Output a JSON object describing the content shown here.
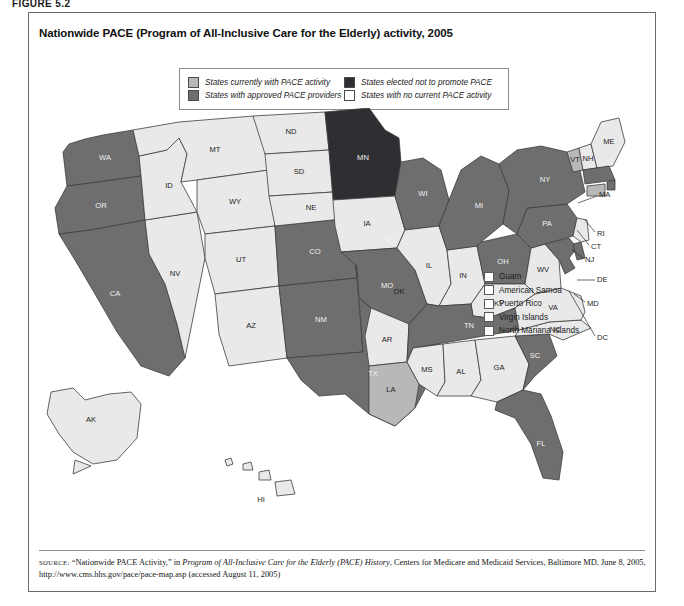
{
  "figure": {
    "label": "FIGURE 5.2"
  },
  "title": "Nationwide PACE (Program of All-Inclusive Care for the Elderly) activity, 2005",
  "legend": {
    "items": [
      {
        "label": "States currently with PACE activity",
        "color": "#b8b8b8"
      },
      {
        "label": "States elected not to promote PACE",
        "color": "#2f2f33"
      },
      {
        "label": "States with approved PACE providers",
        "color": "#6e6e6e"
      },
      {
        "label": "States with no current PACE activity",
        "color": "#ffffff"
      }
    ]
  },
  "territories": {
    "items": [
      {
        "label": "Guam"
      },
      {
        "label": "American Samoa"
      },
      {
        "label": "Puerto Rico"
      },
      {
        "label": "Virgin Islands"
      },
      {
        "label": "North Mariana Islands"
      }
    ]
  },
  "source": {
    "prefix": "SOURCE:",
    "text_1": " “Nationwide PACE Activity,” in ",
    "italic": "Program of All-Inclusive Care for the Elderly (PACE) History",
    "text_2": ", Centers for Medicare and Medicaid Services, Baltimore MD, June 8, 2005, http://www.cms.hhs.gov/pace/pace-map.asp (accessed August 11, 2005)"
  },
  "chart_data": {
    "type": "map",
    "title": "Nationwide PACE (Program of All-Inclusive Care for the Elderly) activity, 2005",
    "region": "United States",
    "categories": [
      "States currently with PACE activity",
      "States with approved PACE providers",
      "States elected not to promote PACE",
      "States with no current PACE activity"
    ],
    "category_colors": {
      "currently_with_activity": "#b8b8b8",
      "approved_providers": "#6e6e6e",
      "elected_not_to_promote": "#2f2f33",
      "no_current_activity": "#e9e9e9"
    },
    "values": {
      "WA": "approved_providers",
      "OR": "approved_providers",
      "CA": "approved_providers",
      "NV": "no_current_activity",
      "ID": "no_current_activity",
      "MT": "no_current_activity",
      "WY": "no_current_activity",
      "UT": "no_current_activity",
      "AZ": "no_current_activity",
      "CO": "approved_providers",
      "NM": "approved_providers",
      "ND": "no_current_activity",
      "SD": "no_current_activity",
      "NE": "no_current_activity",
      "KS": "approved_providers",
      "OK": "no_current_activity",
      "TX": "approved_providers",
      "MN": "elected_not_to_promote",
      "IA": "no_current_activity",
      "MO": "approved_providers",
      "AR": "no_current_activity",
      "LA": "currently_with_activity",
      "WI": "approved_providers",
      "IL": "no_current_activity",
      "IN": "no_current_activity",
      "MI": "approved_providers",
      "OH": "approved_providers",
      "KY": "no_current_activity",
      "TN": "approved_providers",
      "MS": "no_current_activity",
      "AL": "no_current_activity",
      "GA": "no_current_activity",
      "FL": "approved_providers",
      "SC": "approved_providers",
      "NC": "no_current_activity",
      "VA": "no_current_activity",
      "WV": "no_current_activity",
      "MD": "approved_providers",
      "DE": "approved_providers",
      "DC": "approved_providers",
      "PA": "approved_providers",
      "NJ": "no_current_activity",
      "NY": "approved_providers",
      "CT": "currently_with_activity",
      "RI": "approved_providers",
      "MA": "approved_providers",
      "VT": "currently_with_activity",
      "NH": "no_current_activity",
      "ME": "no_current_activity",
      "AK": "no_current_activity",
      "HI": "no_current_activity",
      "GU": "no_current_activity",
      "AS": "no_current_activity",
      "PR": "no_current_activity",
      "VI": "no_current_activity",
      "MP": "no_current_activity"
    },
    "state_labels": [
      "WA",
      "OR",
      "CA",
      "NV",
      "ID",
      "MT",
      "WY",
      "UT",
      "AZ",
      "CO",
      "NM",
      "ND",
      "SD",
      "NE",
      "KS",
      "OK",
      "TX",
      "MN",
      "IA",
      "MO",
      "AR",
      "LA",
      "WI",
      "IL",
      "IN",
      "MI",
      "OH",
      "KY",
      "TN",
      "MS",
      "AL",
      "GA",
      "FL",
      "SC",
      "NC",
      "VA",
      "WV",
      "MD",
      "DE",
      "DC",
      "PA",
      "NJ",
      "NY",
      "CT",
      "RI",
      "MA",
      "VT",
      "NH",
      "ME",
      "AK",
      "HI"
    ]
  }
}
